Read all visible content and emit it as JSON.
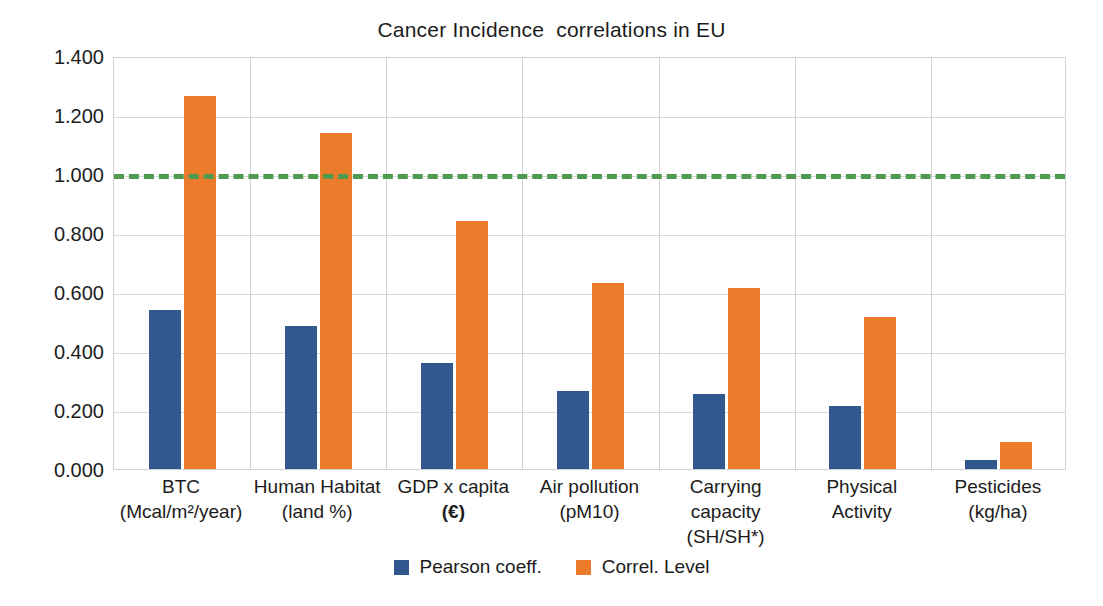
{
  "chart_data": {
    "type": "bar",
    "title": "Cancer Incidence  correlations in EU",
    "xlabel": "",
    "ylabel": "",
    "ylim": [
      0,
      1.4
    ],
    "ytick_step": 0.2,
    "ytick_labels": [
      "1.400",
      "1.200",
      "1.000",
      "0.800",
      "0.600",
      "0.400",
      "0.200",
      "0.000"
    ],
    "ytick_values": [
      1.4,
      1.2,
      1.0,
      0.8,
      0.6,
      0.4,
      0.2,
      0.0
    ],
    "grid": true,
    "legend_position": "bottom",
    "categories": [
      "BTC (Mcal/m2/year)",
      "Human Habitat (land %)",
      "GDP x capita (€)",
      "Air pollution (pM10)",
      "Carrying capacity (SH/SH*)",
      "Physical Activity",
      "Pesticides (kg/ha)"
    ],
    "series": [
      {
        "name": "Pearson coeff.",
        "color": "#31578F",
        "values": [
          0.54,
          0.485,
          0.36,
          0.265,
          0.255,
          0.215,
          0.03
        ]
      },
      {
        "name": "Correl. Level",
        "color": "#EC7C2B",
        "values": [
          1.265,
          1.14,
          0.84,
          0.63,
          0.615,
          0.515,
          0.09
        ]
      }
    ],
    "annotations": [
      {
        "type": "threshold-line",
        "value": 1.0,
        "style": "dashed",
        "color": "#4E9B4F"
      }
    ]
  },
  "x_axis": {
    "categories": [
      {
        "line1": "BTC",
        "line2": "(Mcal/m²/year)",
        "line3": ""
      },
      {
        "line1": "Human Habitat",
        "line2": "(land %)",
        "line3": ""
      },
      {
        "line1": "GDP x capita",
        "line2": "(€)",
        "line3": "",
        "line2_bold": true
      },
      {
        "line1": "Air pollution",
        "line2": "(pM10)",
        "line3": ""
      },
      {
        "line1": "Carrying",
        "line2": "capacity",
        "line3": "(SH/SH*)"
      },
      {
        "line1": "Physical",
        "line2": "Activity",
        "line3": ""
      },
      {
        "line1": "Pesticides",
        "line2": "(kg/ha)",
        "line3": ""
      }
    ]
  },
  "legend": {
    "entries": [
      {
        "label": "Pearson coeff.",
        "color": "#31578F"
      },
      {
        "label": "Correl. Level",
        "color": "#EC7C2B"
      }
    ]
  }
}
